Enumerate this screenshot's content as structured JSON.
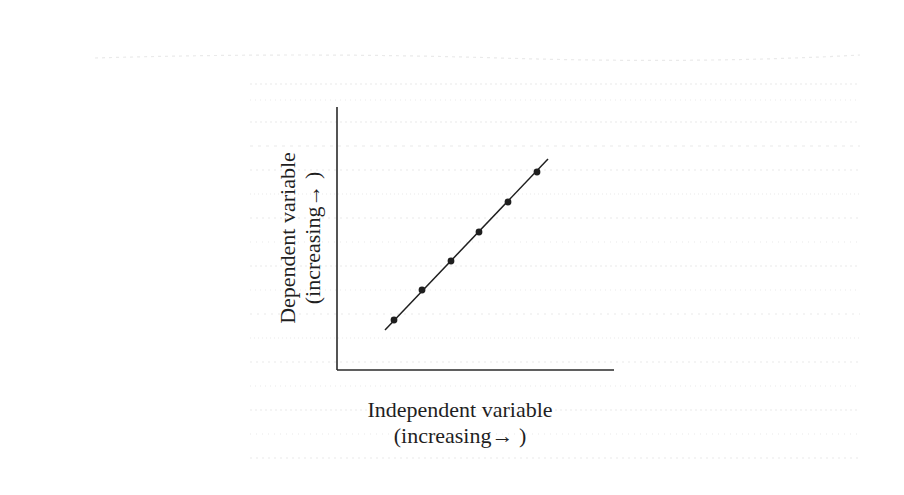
{
  "chart_data": {
    "type": "line",
    "title": "",
    "xlabel": "Independent variable (increasing→ )",
    "ylabel": "Dependent variable (increasing→ )",
    "xlabel_lines": [
      "Independent variable",
      "(increasing→ )"
    ],
    "ylabel_lines": [
      "Dependent variable",
      "(increasing→ )"
    ],
    "grid": false,
    "ticks": false,
    "legend": null,
    "series": [
      {
        "name": "linear relationship",
        "x": [
          1,
          2,
          3,
          4,
          5,
          6
        ],
        "y": [
          1,
          2,
          3,
          4,
          5,
          6
        ],
        "markers": true,
        "fit_line": true
      }
    ],
    "pixel_points": [
      [
        394,
        320
      ],
      [
        422,
        290
      ],
      [
        451,
        261
      ],
      [
        479,
        232
      ],
      [
        508,
        202
      ],
      [
        537,
        172
      ]
    ],
    "fit_line_pixels": {
      "x1": 385,
      "y1": 330,
      "x2": 548,
      "y2": 159
    },
    "axes_pixels": {
      "origin": [
        337,
        370
      ],
      "y_top": 107,
      "x_right": 614
    }
  },
  "colors": {
    "ink": "#1f1f1f",
    "ghost_text": "#cfcfcf",
    "background": "#ffffff"
  }
}
